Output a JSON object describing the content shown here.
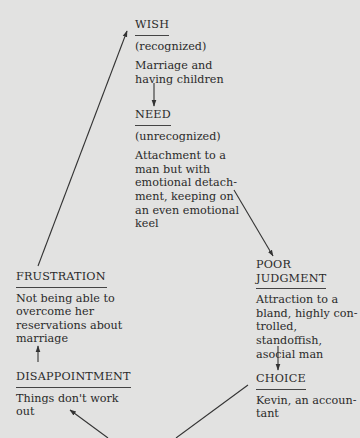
{
  "diagram": {
    "type": "cycle",
    "nodes": [
      {
        "id": "wish",
        "title": "WISH",
        "subtitle": "(recognized)",
        "description": "Marriage and having children"
      },
      {
        "id": "need",
        "title": "NEED",
        "subtitle": "(unrecognized)",
        "description": "Attachment to a man but with emotional detachment, keeping on an even emotional keel"
      },
      {
        "id": "poor_judgment",
        "title": "POOR JUDGMENT",
        "description": "Attraction to a bland, highly controlled, standoffish, asocial man"
      },
      {
        "id": "choice",
        "title": "CHOICE",
        "description": "Kevin, an accountant"
      },
      {
        "id": "disappointment",
        "title": "DISAPPOINTMENT",
        "description": "Things don't work out"
      },
      {
        "id": "frustration",
        "title": "FRUSTRATION",
        "description": "Not being able to overcome her reservations about marriage"
      }
    ],
    "edges": [
      {
        "from": "wish",
        "to": "need"
      },
      {
        "from": "need",
        "to": "poor_judgment"
      },
      {
        "from": "poor_judgment",
        "to": "choice"
      },
      {
        "from": "choice",
        "to": "disappointment"
      },
      {
        "from": "disappointment",
        "to": "frustration"
      },
      {
        "from": "frustration",
        "to": "wish"
      }
    ]
  },
  "wish": {
    "title": "WISH",
    "subtitle": "(recognized)",
    "desc_lines": [
      "Marriage and",
      "having children"
    ]
  },
  "need": {
    "title": "NEED",
    "subtitle": "(unrecognized)",
    "desc_lines": [
      "Attachment to a",
      "man but with",
      "emotional detach-",
      "ment, keeping on",
      "an even emotional",
      "keel"
    ]
  },
  "poor_judgment": {
    "title_lines": [
      "POOR",
      "JUDGMENT"
    ],
    "desc_lines": [
      "Attraction to a",
      "bland, highly con-",
      "trolled, standoffish,",
      "asocial man"
    ]
  },
  "choice": {
    "title": "CHOICE",
    "desc_lines": [
      "Kevin, an accoun-",
      "tant"
    ]
  },
  "disappointment": {
    "title": "DISAPPOINTMENT",
    "desc_lines": [
      "Things don't work",
      "out"
    ]
  },
  "frustration": {
    "title": "FRUSTRATION",
    "desc_lines": [
      "Not being able to",
      "overcome her",
      "reservations about",
      "marriage"
    ]
  }
}
